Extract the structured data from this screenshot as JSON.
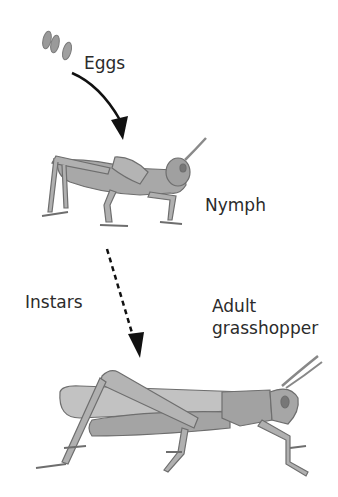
{
  "diagram": {
    "stages": [
      {
        "id": "eggs",
        "label": "Eggs"
      },
      {
        "id": "nymph",
        "label": "Nymph"
      },
      {
        "id": "adult",
        "label_line1": "Adult",
        "label_line2": "grasshopper"
      }
    ],
    "transitions": [
      {
        "from": "eggs",
        "to": "nymph",
        "style": "solid-curved-arrow"
      },
      {
        "from": "nymph",
        "to": "adult",
        "style": "dashed-arrow",
        "label": "Instars"
      }
    ],
    "colors": {
      "arrow": "#111111",
      "insect_fill": "#a8a8a8",
      "insect_outline": "#6e6e6e",
      "text": "#2b2b2b"
    }
  }
}
